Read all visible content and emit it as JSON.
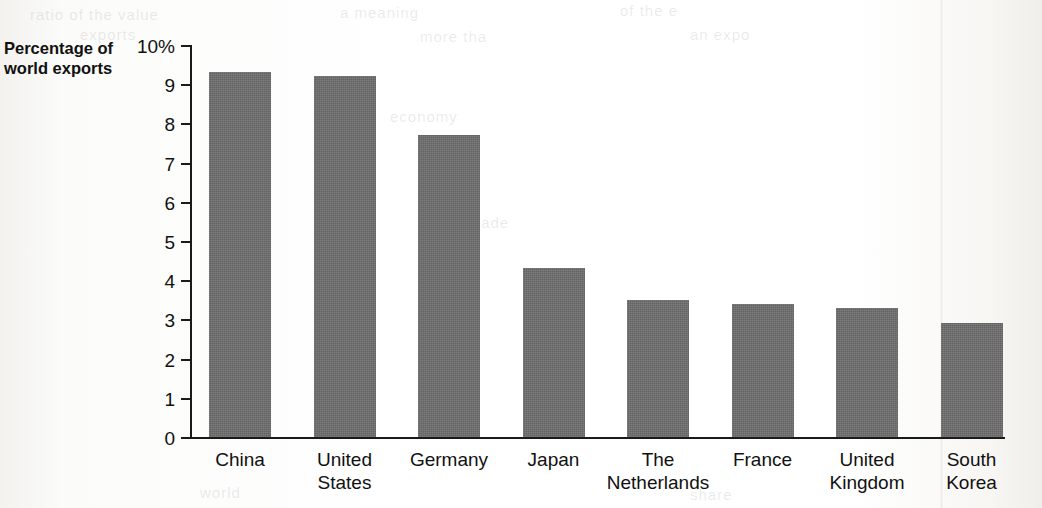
{
  "axis_title": {
    "line1": "Percentage of",
    "line2": "world exports"
  },
  "chart_data": {
    "type": "bar",
    "title": "",
    "subtitle": "",
    "xlabel": "",
    "ylabel": "Percentage of world exports",
    "ylim": [
      0,
      10
    ],
    "grid": false,
    "legend": null,
    "y_tick_labels": [
      "10%",
      "9",
      "8",
      "7",
      "6",
      "5",
      "4",
      "3",
      "2",
      "1",
      "0"
    ],
    "y_tick_values": [
      10,
      9,
      8,
      7,
      6,
      5,
      4,
      3,
      2,
      1,
      0
    ],
    "categories": [
      "China",
      "United States",
      "Germany",
      "Japan",
      "The Netherlands",
      "France",
      "United Kingdom",
      "South Korea"
    ],
    "category_label_lines": [
      [
        "China"
      ],
      [
        "United",
        "States"
      ],
      [
        "Germany"
      ],
      [
        "Japan"
      ],
      [
        "The",
        "Netherlands"
      ],
      [
        "France"
      ],
      [
        "United",
        "Kingdom"
      ],
      [
        "South",
        "Korea"
      ]
    ],
    "values": [
      9.3,
      9.2,
      7.7,
      4.3,
      3.5,
      3.4,
      3.3,
      2.9
    ],
    "bar_color": "#6d6d6d",
    "axis_color": "#1a1a1a"
  }
}
